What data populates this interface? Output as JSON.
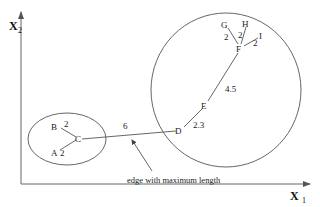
{
  "axes": {
    "x_label": "X",
    "x_sub": "1",
    "y_label": "X",
    "y_sub": "2"
  },
  "clusters": [
    {
      "name": "left-cluster",
      "nodes": [
        "A",
        "B",
        "C"
      ]
    },
    {
      "name": "right-cluster",
      "nodes": [
        "D",
        "E",
        "F",
        "G",
        "H",
        "I"
      ]
    }
  ],
  "nodes": {
    "A": "A",
    "B": "B",
    "C": "C",
    "D": "D",
    "E": "E",
    "F": "F",
    "G": "G",
    "H": "H",
    "I": "I"
  },
  "edges": [
    {
      "from": "B",
      "to": "C",
      "weight": "2"
    },
    {
      "from": "A",
      "to": "C",
      "weight": "2"
    },
    {
      "from": "C",
      "to": "D",
      "weight": "6"
    },
    {
      "from": "D",
      "to": "E",
      "weight": "2.3"
    },
    {
      "from": "E",
      "to": "F",
      "weight": "4.5"
    },
    {
      "from": "F",
      "to": "G",
      "weight": "2"
    },
    {
      "from": "F",
      "to": "H",
      "weight": "2"
    },
    {
      "from": "F",
      "to": "I",
      "weight": "2"
    }
  ],
  "annotation": {
    "text": "edge with maximum length",
    "target_edge": "C-D"
  }
}
